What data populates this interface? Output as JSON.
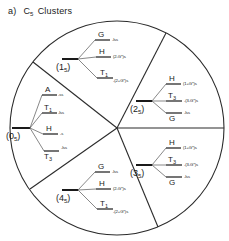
{
  "figure": {
    "panel_label": "a)",
    "species": "C",
    "species_subscript": "5",
    "title_word": "Clusters"
  },
  "sectors": [
    {
      "id": "0_5",
      "name": "(0",
      "subscript": "5",
      "close": ")",
      "levels": [
        {
          "term": "A",
          "sub": "",
          "annot": "-ss"
        },
        {
          "term": "T",
          "sub": "1",
          "annot": "-lss"
        },
        {
          "term": "H",
          "sub": "",
          "annot": "-s"
        },
        {
          "term": "T",
          "sub": "3",
          "annot": "-lss"
        }
      ]
    },
    {
      "id": "1_5",
      "name": "(1",
      "subscript": "5",
      "close": ")",
      "levels": [
        {
          "term": "G",
          "sub": "",
          "annot": "-lss"
        },
        {
          "term": "H",
          "sub": "",
          "annot": "(2-G*)s"
        },
        {
          "term": "T",
          "sub": "1",
          "annot": "-(2+G*)s"
        }
      ]
    },
    {
      "id": "2_5",
      "name": "(2",
      "subscript": "5",
      "close": ")",
      "levels": [
        {
          "term": "H",
          "sub": "",
          "annot": "(1+G*)s"
        },
        {
          "term": "T",
          "sub": "3",
          "annot": "-(3-G*)s"
        },
        {
          "term": "G",
          "sub": "",
          "annot": "-lss"
        }
      ]
    },
    {
      "id": "3_5",
      "name": "(3",
      "subscript": "5",
      "close": ")",
      "levels": [
        {
          "term": "H",
          "sub": "",
          "annot": "(1+G*)s"
        },
        {
          "term": "T",
          "sub": "3",
          "annot": "-(3-G*)s"
        },
        {
          "term": "G",
          "sub": "",
          "annot": "-lss"
        }
      ]
    },
    {
      "id": "4_5",
      "name": "(4",
      "subscript": "5",
      "close": ")",
      "levels": [
        {
          "term": "G",
          "sub": "",
          "annot": "-lss"
        },
        {
          "term": "H",
          "sub": "",
          "annot": "(2-G*)s"
        },
        {
          "term": "T",
          "sub": "1",
          "annot": "-(2+G*)s"
        }
      ]
    }
  ],
  "colors": {
    "ink": "#1a1a1a",
    "stroke": "#2b2b2b",
    "background": "#ffffff"
  }
}
